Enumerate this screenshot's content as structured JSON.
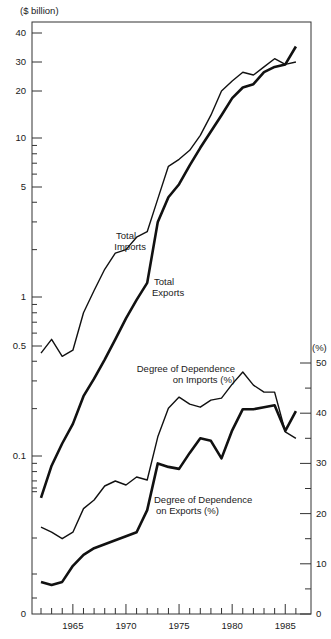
{
  "chart_data": {
    "type": "line",
    "title": "",
    "xlabel": "",
    "ylabel_left": "($ billion)",
    "ylabel_right": "(%)",
    "x": [
      1962,
      1963,
      1964,
      1965,
      1966,
      1967,
      1968,
      1969,
      1970,
      1971,
      1972,
      1973,
      1974,
      1975,
      1976,
      1977,
      1978,
      1979,
      1980,
      1981,
      1982,
      1983,
      1984,
      1985,
      1986
    ],
    "x_ticks": [
      "1965",
      "1970",
      "1975",
      "1980",
      "1985"
    ],
    "left_axis": {
      "scale": "log",
      "ticks": [
        "40",
        "30",
        "20",
        "10",
        "5",
        "1",
        "0.5",
        "0.1",
        "0"
      ]
    },
    "right_axis": {
      "scale": "linear",
      "ylim": [
        0,
        50
      ],
      "ticks": [
        "50",
        "40",
        "30",
        "20",
        "10",
        "0"
      ]
    },
    "series": [
      {
        "name": "Total Imports",
        "axis": "left",
        "unit": "$ billion",
        "style": "thin",
        "values": [
          0.45,
          0.55,
          0.43,
          0.47,
          0.8,
          1.1,
          1.5,
          1.9,
          2.0,
          2.4,
          2.6,
          4.2,
          6.7,
          7.4,
          8.4,
          10.4,
          14,
          20,
          23,
          26,
          25,
          28,
          31,
          29,
          30
        ]
      },
      {
        "name": "Total Exports",
        "axis": "left",
        "unit": "$ billion",
        "style": "thick",
        "values": [
          0.055,
          0.087,
          0.12,
          0.16,
          0.24,
          0.31,
          0.41,
          0.55,
          0.74,
          0.96,
          1.23,
          3.0,
          4.3,
          5.2,
          6.8,
          8.7,
          11,
          14,
          18,
          21,
          22,
          26,
          28,
          29,
          35
        ]
      },
      {
        "name": "Degree of Dependence on Imports (%)",
        "axis": "right",
        "unit": "%",
        "style": "thin",
        "values": [
          17.3,
          16.3,
          15.0,
          16.3,
          21.0,
          22.7,
          25.5,
          26.5,
          25.7,
          27.3,
          26.7,
          35.3,
          41.0,
          43.2,
          41.8,
          41.2,
          42.6,
          43.0,
          45.8,
          48.2,
          45.6,
          44.2,
          44.2,
          36.3,
          35.0
        ]
      },
      {
        "name": "Degree of Dependence on Exports (%)",
        "axis": "right",
        "unit": "%",
        "style": "thick",
        "values": [
          6.4,
          5.8,
          6.4,
          9.6,
          11.8,
          13.1,
          13.9,
          14.7,
          15.5,
          16.3,
          20.7,
          30.0,
          29.3,
          28.9,
          32.1,
          35.0,
          34.5,
          31.0,
          36.6,
          40.8,
          40.8,
          41.2,
          41.6,
          36.5,
          40.4
        ]
      }
    ],
    "annotations": [
      {
        "text": "Total\nImports",
        "near": "Total Imports"
      },
      {
        "text": "Total\nExports",
        "near": "Total Exports"
      },
      {
        "text": "Degree of Dependence\non Imports (%)",
        "near": "Degree of Dependence on Imports (%)"
      },
      {
        "text": "Degree of Dependence\non Exports (%)",
        "near": "Degree of Dependence on Exports (%)"
      }
    ],
    "grid": false,
    "legend": "inline labels"
  },
  "labels": {
    "left_unit": "($ billion)",
    "right_unit": "(%)",
    "imports_1": "Total",
    "imports_2": "Imports",
    "exports_1": "Total",
    "exports_2": "Exports",
    "dep_imp_1": "Degree of Dependence",
    "dep_imp_2": "on Imports (%)",
    "dep_exp_1": "Degree of Dependence",
    "dep_exp_2": "on Exports (%)"
  },
  "colors": {
    "line": "#111111",
    "axis": "#333333",
    "background": "#ffffff"
  }
}
